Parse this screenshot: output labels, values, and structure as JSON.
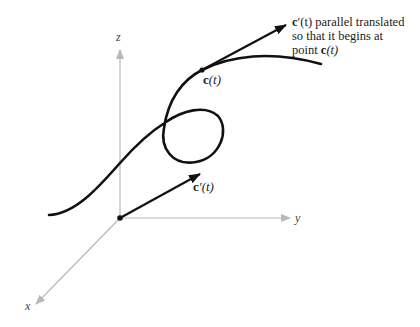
{
  "axes": {
    "z_label": "z",
    "y_label": "y",
    "x_label": "x",
    "color": "#b8b8b8"
  },
  "curve": {
    "point_label_bold": "c",
    "point_label_rest": "(t)"
  },
  "vector_origin": {
    "label_bold": "c",
    "label_rest": "′(t)"
  },
  "annotation": {
    "line1_bold": "c",
    "line1_rest": "′(t) parallel translated",
    "line2": "so that it begins at",
    "line3_prefix": "point ",
    "line3_bold": "c",
    "line3_rest": "(t)"
  },
  "colors": {
    "curve": "#111111",
    "axis": "#b8b8b8"
  }
}
